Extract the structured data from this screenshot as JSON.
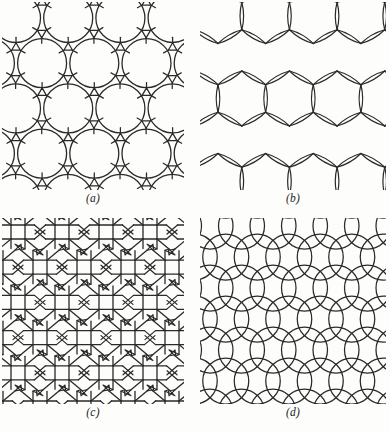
{
  "figure": {
    "background_color": "#fdfdfc",
    "stroke_color": "#2a2a2a",
    "panel_count": 4
  },
  "panels": [
    {
      "id": "a",
      "caption": "(a)",
      "tiling_name": "truncated-hexagonal-trihexagonal-net",
      "description": "Net of large circles (dodecagons) joined by small triangles and short bonds",
      "x": 2,
      "y": 2,
      "width": 182,
      "height": 188
    },
    {
      "id": "b",
      "caption": "(b)",
      "tiling_name": "hexagonal-lens-edge-net",
      "description": "Honeycomb lattice in which every edge is drawn as a thin lens (vesica) of two arcs",
      "x": 200,
      "y": 2,
      "width": 186,
      "height": 188
    },
    {
      "id": "c",
      "caption": "(c)",
      "tiling_name": "square-triangle-octagon-net",
      "description": "Net of squares and triangles surrounding octagonal and hexagonal openings",
      "x": 2,
      "y": 218,
      "width": 182,
      "height": 186
    },
    {
      "id": "d",
      "caption": "(d)",
      "tiling_name": "overlapping-circle-net",
      "description": "Array of overlapping circles arranged on a square lattice",
      "x": 200,
      "y": 218,
      "width": 186,
      "height": 186
    }
  ],
  "chart_data": {
    "type": "diagram",
    "title": "",
    "subtitle": "",
    "items": [
      {
        "label": "(a)",
        "content": "circle-and-triangle net"
      },
      {
        "label": "(b)",
        "content": "lens-edge hexagonal net"
      },
      {
        "label": "(c)",
        "content": "square-triangle net"
      },
      {
        "label": "(d)",
        "content": "overlapping circles net"
      }
    ]
  }
}
